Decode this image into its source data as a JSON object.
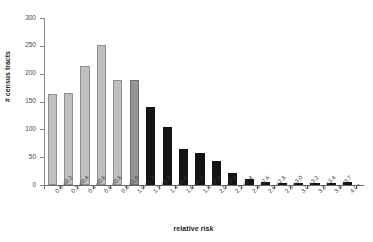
{
  "chart_data": {
    "type": "bar",
    "title": "",
    "xlabel": "relative risk",
    "ylabel": "# census tracts",
    "ylim": [
      0,
      300
    ],
    "yticks": [
      0,
      50,
      100,
      150,
      200,
      250,
      300
    ],
    "grid": false,
    "legend": "none",
    "categories": [
      "0.0-<0.2",
      "0.2-<0.4",
      "0.4-<0.6",
      "0.6-<0.8",
      "0.8-<1.0",
      "1.0-<1.2",
      "1.2-<1.4",
      "1.4-<1.6",
      "1.6-<1.8",
      "1.8-<2.0",
      "2.0-<2.2",
      "2.2-<2.4",
      "2.4-<2.6",
      "2.6-<2.8",
      "2.8-<3.0",
      "3.0-<3.2",
      "3.2-<3.4",
      "3.4-<3.7",
      "4.0+"
    ],
    "values": [
      163,
      166,
      214,
      252,
      188,
      188,
      141,
      104,
      65,
      58,
      43,
      22,
      10,
      6,
      3,
      2,
      3,
      2,
      5
    ],
    "bar_colors": [
      "#bfbfbf",
      "#bfbfbf",
      "#bfbfbf",
      "#bfbfbf",
      "#bfbfbf",
      "#959595",
      "#141414",
      "#141414",
      "#141414",
      "#141414",
      "#141414",
      "#141414",
      "#141414",
      "#141414",
      "#141414",
      "#141414",
      "#141414",
      "#141414",
      "#141414"
    ],
    "color_classes": [
      "light",
      "light",
      "light",
      "light",
      "light",
      "mid",
      "dark",
      "dark",
      "dark",
      "dark",
      "dark",
      "dark",
      "dark",
      "dark",
      "dark",
      "dark",
      "dark",
      "dark",
      "dark"
    ]
  },
  "colors": {
    "axis": "#6b6b6b",
    "tick_label": "#4a4a4a",
    "axis_title": "#1f1f1f",
    "background": "#ffffff",
    "bar_light": "#bfbfbf",
    "bar_mid": "#959595",
    "bar_dark": "#141414"
  }
}
